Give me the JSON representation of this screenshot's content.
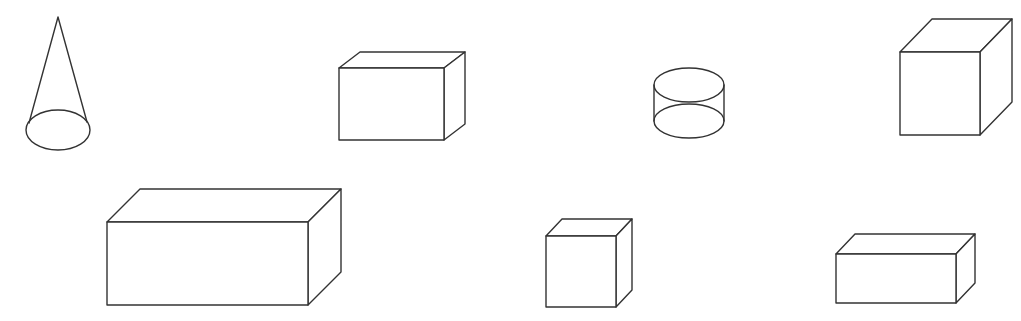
{
  "figure": {
    "width": 1021,
    "height": 321,
    "stroke_color": "#333333",
    "background": "#ffffff"
  },
  "shapes": [
    {
      "id": "cone",
      "type": "cone",
      "apex": [
        58,
        17
      ],
      "base_center": [
        58,
        130
      ],
      "rx": 32,
      "ry": 20,
      "tangent_left": [
        29,
        123
      ],
      "tangent_right": [
        87,
        122
      ]
    },
    {
      "id": "box-top-middle",
      "type": "cuboid",
      "x": 339,
      "y": 68,
      "w": 105,
      "h": 72,
      "dx": 21,
      "dy": -16
    },
    {
      "id": "cylinder",
      "type": "cylinder",
      "cx": 689,
      "top_cy": 85,
      "bottom_cy": 121,
      "rx": 35,
      "ry": 17
    },
    {
      "id": "cube-top-right",
      "type": "cuboid",
      "x": 900,
      "y": 52,
      "w": 80,
      "h": 83,
      "dx": 32,
      "dy": -33
    },
    {
      "id": "box-large-bottom-left",
      "type": "cuboid",
      "x": 107,
      "y": 222,
      "w": 201,
      "h": 83,
      "dx": 33,
      "dy": -33
    },
    {
      "id": "cube-small-bottom-middle",
      "type": "cuboid",
      "x": 546,
      "y": 236,
      "w": 70,
      "h": 71,
      "dx": 16,
      "dy": -17
    },
    {
      "id": "box-flat-bottom-right",
      "type": "cuboid",
      "x": 836,
      "y": 254,
      "w": 120,
      "h": 49,
      "dx": 19,
      "dy": -20
    }
  ]
}
